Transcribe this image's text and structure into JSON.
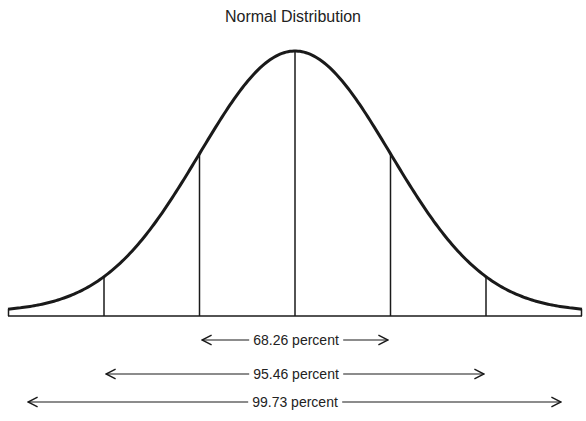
{
  "chart_data": {
    "type": "line",
    "title": "Normal Distribution",
    "xlabel": "",
    "ylabel": "",
    "grid": false,
    "legend": null,
    "curve": "standard normal density (bell curve)",
    "x_sigma_markers": [
      -3,
      -2,
      -1,
      0,
      1,
      2,
      3
    ],
    "annotations": [
      {
        "label": "68.26 percent",
        "range_sigma": [
          -1,
          1
        ],
        "value": 68.26
      },
      {
        "label": "95.46 percent",
        "range_sigma": [
          -2,
          2
        ],
        "value": 95.46
      },
      {
        "label": "99.73 percent",
        "range_sigma": [
          -3,
          3
        ],
        "value": 99.73
      }
    ]
  },
  "labels": {
    "title": "Normal Distribution",
    "p68": "68.26 percent",
    "p95": "95.46 percent",
    "p99": "99.73 percent"
  },
  "colors": {
    "stroke": "#1a1a1a",
    "background": "#ffffff"
  }
}
